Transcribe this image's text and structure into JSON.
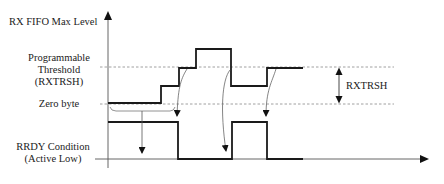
{
  "labels": {
    "y_axis_title": "RX FIFO Max Level",
    "threshold_line1": "Programmable",
    "threshold_line2": "Threshold",
    "threshold_line3": "(RXTRSH)",
    "zero_byte": "Zero byte",
    "rrdy_line1": "RRDY Condition",
    "rrdy_line2": "(Active Low)",
    "dimension_label": "RXTRSH"
  },
  "colors": {
    "signal": "#1a1a1a",
    "axis": "#555555",
    "dashed": "#888888",
    "annotation": "#666666"
  },
  "fifo_level_waveform": {
    "description": "FIFO level steps: zero -> mid -> threshold -> above threshold -> mid -> threshold",
    "steps": [
      "zero",
      "mid",
      "threshold",
      "max",
      "mid",
      "threshold"
    ]
  },
  "rrdy_waveform": {
    "description": "RRDY active low: high, low, high, low",
    "states": [
      "high",
      "low",
      "high",
      "low"
    ]
  }
}
